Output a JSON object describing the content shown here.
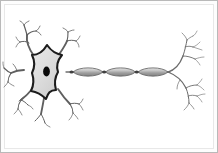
{
  "figure": {
    "orientation": "soma at left, axon extending right",
    "background_color": "#ffffff",
    "frame": {
      "border_color": "#b9b9b9",
      "mat_color": "#ffffff",
      "mat_border_color": "#e8e8e8",
      "border_width_px": 1
    }
  },
  "palette": {
    "outline": "#2b2b2b",
    "soma_fill": "#dcdcdc",
    "soma_outline": "#1e1e1e",
    "nucleus_fill": "#0a0a0a",
    "dendrite_stroke": "#5a5a5a",
    "dendrite_stroke_light": "#8a8a8a",
    "axon_stroke": "#6e6e6e",
    "myelin_fill_light": "#cfcfcf",
    "myelin_fill_dark": "#8e8e8e",
    "myelin_outline": "#585858",
    "node_fill": "#3a3a3a"
  },
  "parts": [
    {
      "id": "soma",
      "label": "Soma (cell body)",
      "shape": "six-pointed star with concave sides",
      "center": {
        "x": 47,
        "y": 71
      },
      "radius_px": 26,
      "fill": "#dcdcdc",
      "outline": "#1e1e1e",
      "outline_width_px": 2.2
    },
    {
      "id": "nucleus",
      "label": "Nucleus",
      "shape": "vertical ellipse",
      "center": {
        "x": 47,
        "y": 71
      },
      "rx_px": 3.4,
      "ry_px": 5.0,
      "fill": "#0a0a0a"
    },
    {
      "id": "dendrites",
      "label": "Dendrites",
      "count": 6,
      "side": "left",
      "stroke": "#5a5a5a",
      "description": "branching tapered processes radiating from soma, each splitting twice into fine tips"
    },
    {
      "id": "axon",
      "label": "Axon",
      "from": {
        "x": 70,
        "y": 72
      },
      "to": {
        "x": 168,
        "y": 72
      },
      "stroke": "#6e6e6e",
      "stroke_width_px": 1.2
    },
    {
      "id": "myelin_sheath",
      "label": "Myelin sheath",
      "count": 3,
      "shape": "elongated lens / spindle",
      "segment_length_px": 30,
      "segment_height_px": 7.5,
      "segments": [
        {
          "cx": 88,
          "cy": 72
        },
        {
          "cx": 120,
          "cy": 72
        },
        {
          "cx": 152,
          "cy": 72
        }
      ],
      "fill_gradient": [
        "#cfcfcf",
        "#8e8e8e"
      ],
      "outline": "#585858"
    },
    {
      "id": "nodes_of_ranvier",
      "label": "Nodes of Ranvier",
      "count": 2,
      "positions": [
        {
          "x": 104,
          "y": 72
        },
        {
          "x": 136,
          "y": 72
        }
      ],
      "fill": "#3a3a3a"
    },
    {
      "id": "axon_terminals",
      "label": "Axon terminals",
      "count": 2,
      "side": "right",
      "branch_point": {
        "x": 170,
        "y": 72
      },
      "stroke": "#6e6e6e",
      "description": "axon splits into an upper and lower arbor, each branching into fine twigs"
    }
  ],
  "geometry": {
    "canvas": {
      "width": 218,
      "height": 153
    },
    "soma_star_points": [
      [
        47,
        45
      ],
      [
        63,
        55
      ],
      [
        70,
        72
      ],
      [
        62,
        90
      ],
      [
        47,
        99
      ],
      [
        30,
        90
      ],
      [
        24,
        72
      ],
      [
        31,
        55
      ]
    ]
  }
}
